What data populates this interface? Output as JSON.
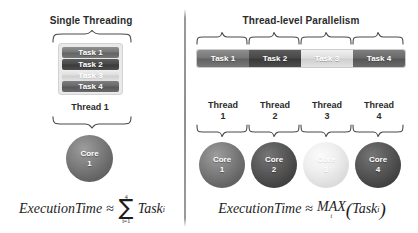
{
  "diagram": {
    "title_left": "Single Threading",
    "title_right": "Thread-level Parallelism",
    "divider": "vertical-divider"
  },
  "left_panel": {
    "heading": "Single Threading",
    "tasks": [
      {
        "label": "Task 1",
        "shade": "#787878"
      },
      {
        "label": "Task 2",
        "shade": "#494949"
      },
      {
        "label": "Task 3",
        "shade": "#dedede"
      },
      {
        "label": "Task 4",
        "shade": "#696969"
      }
    ],
    "thread_label": "Thread 1",
    "core": {
      "name": "Core",
      "number": "1",
      "shade": "#7f7f7f"
    },
    "formula": {
      "lhs": "ExecutionTime",
      "approx": "≈",
      "sigma": "∑",
      "sigma_upper": "4",
      "sigma_lower": "i=1",
      "term": "Task",
      "term_sub": "i"
    }
  },
  "right_panel": {
    "heading": "Thread-level Parallelism",
    "tasks": [
      {
        "label": "Task 1",
        "shade": "#787878"
      },
      {
        "label": "Task 2",
        "shade": "#494949"
      },
      {
        "label": "Task 3",
        "shade": "#dedede"
      },
      {
        "label": "Task 4",
        "shade": "#565656"
      }
    ],
    "threads": [
      {
        "name": "Thread",
        "number": "1"
      },
      {
        "name": "Thread",
        "number": "2"
      },
      {
        "name": "Thread",
        "number": "3"
      },
      {
        "name": "Thread",
        "number": "4"
      }
    ],
    "cores": [
      {
        "name": "Core",
        "number": "1",
        "shade": "#7f7f7f"
      },
      {
        "name": "Core",
        "number": "2",
        "shade": "#5a5a5a"
      },
      {
        "name": "Core",
        "number": "3",
        "shade": "#efefef"
      },
      {
        "name": "Core",
        "number": "4",
        "shade": "#5a5a5a"
      }
    ],
    "formula": {
      "lhs": "ExecutionTime",
      "approx": "≈",
      "func": "MAX",
      "func_sub": "i",
      "open_paren": "(",
      "term": "Task",
      "term_sub": "i",
      "close_paren": ")"
    }
  },
  "colors": {
    "background": "#ffffff",
    "text": "#2b2b2b",
    "brace": "#4a4a4a",
    "divider": "#8f8f8f"
  }
}
